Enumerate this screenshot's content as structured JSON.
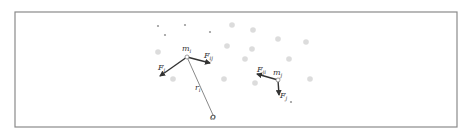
{
  "diagram": {
    "frame": {
      "x": 15,
      "y": 12,
      "w": 442,
      "h": 115
    },
    "background_particles": [
      {
        "x": 232,
        "y": 25
      },
      {
        "x": 253,
        "y": 30
      },
      {
        "x": 278,
        "y": 39
      },
      {
        "x": 306,
        "y": 42
      },
      {
        "x": 158,
        "y": 52
      },
      {
        "x": 227,
        "y": 46
      },
      {
        "x": 252,
        "y": 49
      },
      {
        "x": 245,
        "y": 59
      },
      {
        "x": 289,
        "y": 59
      },
      {
        "x": 173,
        "y": 79
      },
      {
        "x": 224,
        "y": 79
      },
      {
        "x": 255,
        "y": 83
      },
      {
        "x": 310,
        "y": 79
      }
    ],
    "small_particles": [
      {
        "x": 158,
        "y": 26
      },
      {
        "x": 165,
        "y": 35
      },
      {
        "x": 185,
        "y": 25
      },
      {
        "x": 210,
        "y": 32
      },
      {
        "x": 291,
        "y": 102
      }
    ],
    "particle_i": {
      "x": 187,
      "y": 57,
      "label": "m",
      "sub": "i"
    },
    "particle_j": {
      "x": 278,
      "y": 80,
      "label": "m",
      "sub": "j"
    },
    "origin": {
      "x": 213,
      "y": 117,
      "label": "O"
    },
    "position_vector": {
      "label": "r",
      "sub": "i"
    },
    "forces": [
      {
        "name": "F_i",
        "label": "F",
        "sub": "i",
        "from": [
          187,
          57
        ],
        "to": [
          160,
          76
        ],
        "label_pos": [
          158,
          70
        ]
      },
      {
        "name": "F_ij",
        "label": "F",
        "sub": "ij",
        "from": [
          187,
          57
        ],
        "to": [
          210,
          63
        ],
        "label_pos": [
          204,
          58
        ]
      },
      {
        "name": "F_ji",
        "label": "F",
        "sub": "ji",
        "from": [
          278,
          80
        ],
        "to": [
          257,
          74
        ],
        "label_pos": [
          257,
          72
        ]
      },
      {
        "name": "F_j",
        "label": "F",
        "sub": "j",
        "from": [
          278,
          80
        ],
        "to": [
          279,
          95
        ],
        "label_pos": [
          280,
          98
        ]
      }
    ],
    "colors": {
      "frame": "#8a8a8a",
      "dot": "#dcdcdc",
      "vector": "#333333"
    }
  }
}
